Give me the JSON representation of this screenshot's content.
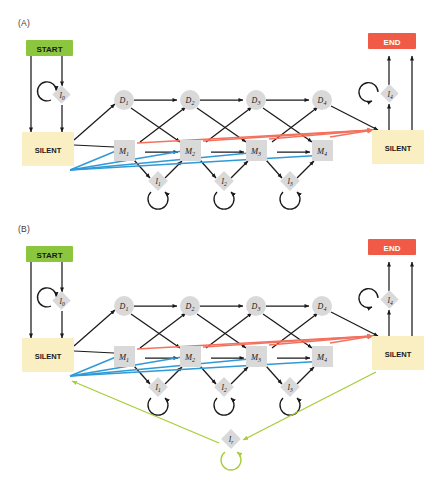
{
  "figure": {
    "width": 439,
    "height": 488,
    "background": "#ffffff"
  },
  "colors": {
    "start_fill": "#8cc63f",
    "end_fill": "#f05a46",
    "silent_fill": "#faeec3",
    "node_gray": "#d9d9d9",
    "edge_black": "#1a1a1a",
    "edge_red": "#f4715e",
    "edge_blue": "#2f9ad6",
    "edge_green": "#a6ce39",
    "label_text": "#3b3b3b"
  },
  "panels": [
    {
      "id": "A",
      "label": "(A)",
      "nodes": {
        "start": "START",
        "end": "END",
        "silent_left": "SILENT",
        "silent_right": "SILENT",
        "i0": "I0",
        "i4": "I4",
        "delete": [
          "D1",
          "D2",
          "D3",
          "D4"
        ],
        "match": [
          "M1",
          "M2",
          "M3",
          "M4"
        ],
        "insert": [
          "I1",
          "I2",
          "I3"
        ]
      }
    },
    {
      "id": "B",
      "label": "(B)",
      "nodes": {
        "start": "START",
        "end": "END",
        "silent_left": "SILENT",
        "silent_right": "SILENT",
        "i0": "I0",
        "i4": "I4",
        "delete": [
          "D1",
          "D2",
          "D3",
          "D4"
        ],
        "match": [
          "M1",
          "M2",
          "M3",
          "M4"
        ],
        "insert": [
          "I1",
          "I2",
          "I3"
        ],
        "random": "Ir"
      }
    }
  ],
  "node_labels": {
    "D1": {
      "base": "D",
      "sub": "1"
    },
    "D2": {
      "base": "D",
      "sub": "2"
    },
    "D3": {
      "base": "D",
      "sub": "3"
    },
    "D4": {
      "base": "D",
      "sub": "4"
    },
    "M1": {
      "base": "M",
      "sub": "1"
    },
    "M2": {
      "base": "M",
      "sub": "2"
    },
    "M3": {
      "base": "M",
      "sub": "3"
    },
    "M4": {
      "base": "M",
      "sub": "4"
    },
    "I0": {
      "base": "I",
      "sub": "0"
    },
    "I1": {
      "base": "I",
      "sub": "1"
    },
    "I2": {
      "base": "I",
      "sub": "2"
    },
    "I3": {
      "base": "I",
      "sub": "3"
    },
    "I4": {
      "base": "I",
      "sub": "4"
    },
    "Ir": {
      "base": "I",
      "sub": "r"
    }
  }
}
